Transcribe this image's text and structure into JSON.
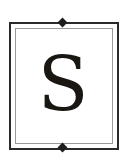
{
  "monogram": {
    "letter": "S",
    "letter_color": "#1a1612",
    "frame_outer_color": "#2a2a2a",
    "frame_inner_color": "#9a9a9a",
    "ornament": "diamond"
  }
}
